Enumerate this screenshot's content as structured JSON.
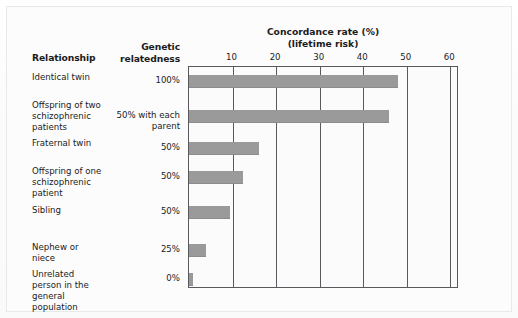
{
  "headers": {
    "relationship": "Relationship",
    "relatedness": "Genetic relatedness"
  },
  "chart_data": {
    "type": "bar",
    "orientation": "horizontal",
    "title": "Concordance rate (%)",
    "subtitle": "(lifetime risk)",
    "xlabel": "Concordance rate (%) (lifetime risk)",
    "ylabel": "Relationship",
    "xlim": [
      0,
      62
    ],
    "ticks": [
      10,
      20,
      30,
      40,
      50,
      60
    ],
    "tick_labels": [
      "10",
      "20",
      "30",
      "40",
      "50",
      "60"
    ],
    "grid": true,
    "legend": null,
    "bar_color": "#9a9a9a",
    "categories": [
      "Identical twin",
      "Offspring of two schizophrenic patients",
      "Fraternal twin",
      "Offspring of one schizophrenic patient",
      "Sibling",
      "Nephew or niece",
      "Unrelated person in the general population"
    ],
    "values": [
      48,
      46,
      16,
      12.5,
      9.5,
      4,
      1
    ]
  },
  "rows": [
    {
      "label": "Identical twin",
      "relatedness": "100%",
      "value": 48
    },
    {
      "label": "Offspring of two schizophrenic patients",
      "relatedness": "50% with each parent",
      "value": 46
    },
    {
      "label": "Fraternal twin",
      "relatedness": "50%",
      "value": 16
    },
    {
      "label": "Offspring of one schizophrenic patient",
      "relatedness": "50%",
      "value": 12.5
    },
    {
      "label": "Sibling",
      "relatedness": "50%",
      "value": 9.5
    },
    {
      "label": "Nephew or niece",
      "relatedness": "25%",
      "value": 4
    },
    {
      "label": "Unrelated person in the general population",
      "relatedness": "0%",
      "value": 1
    }
  ]
}
